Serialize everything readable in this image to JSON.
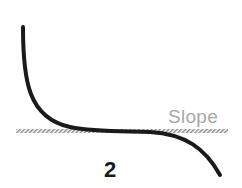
{
  "diagram": {
    "slope_label": "Slope",
    "figure_number": "2",
    "colors": {
      "curve": "#1a1a1a",
      "slope_line": "#9a9a9a",
      "slope_text": "#a8a8a8",
      "number": "#1a1a1a"
    }
  }
}
